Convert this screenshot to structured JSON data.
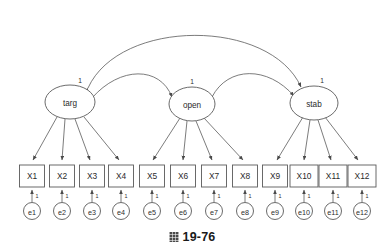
{
  "figure": {
    "caption_glyph": "figure-marker-glyph",
    "caption_number": "19-76",
    "diagram_type": "structural-equation-model-path-diagram"
  },
  "latent_factors": [
    {
      "id": "targ",
      "label": "targ",
      "cx": 70,
      "cy": 102,
      "rx": 25,
      "ry": 17,
      "fixed_label": "1",
      "fixed_x": 80,
      "fixed_y": 80
    },
    {
      "id": "open",
      "label": "open",
      "cx": 192,
      "cy": 104,
      "rx": 23,
      "ry": 17,
      "fixed_label": "1",
      "fixed_y": 81,
      "fixed_x": 192
    },
    {
      "id": "stab",
      "label": "stab",
      "cx": 314,
      "cy": 103,
      "rx": 24,
      "ry": 17,
      "fixed_label": "1",
      "fixed_x": 322,
      "fixed_y": 80
    }
  ],
  "indicators": [
    {
      "id": "X1",
      "label": "X1",
      "cx": 32,
      "factor": "targ",
      "width": 25
    },
    {
      "id": "X2",
      "label": "X2",
      "cx": 62,
      "factor": "targ",
      "width": 25
    },
    {
      "id": "X3",
      "label": "X3",
      "cx": 92,
      "factor": "targ",
      "width": 25
    },
    {
      "id": "X4",
      "label": "X4",
      "cx": 121,
      "factor": "targ",
      "width": 25
    },
    {
      "id": "X5",
      "label": "X5",
      "cx": 152,
      "factor": "open",
      "width": 25
    },
    {
      "id": "X6",
      "label": "X6",
      "cx": 183,
      "factor": "open",
      "width": 25
    },
    {
      "id": "X7",
      "label": "X7",
      "cx": 214,
      "factor": "open",
      "width": 25
    },
    {
      "id": "X8",
      "label": "X8",
      "cx": 245,
      "factor": "open",
      "width": 25
    },
    {
      "id": "X9",
      "label": "X9",
      "cx": 275,
      "factor": "stab",
      "width": 25
    },
    {
      "id": "X10",
      "label": "X10",
      "cx": 304,
      "factor": "stab",
      "width": 28
    },
    {
      "id": "X11",
      "label": "X11",
      "cx": 333,
      "factor": "stab",
      "width": 28
    },
    {
      "id": "X12",
      "label": "X12",
      "cx": 362,
      "factor": "stab",
      "width": 28
    }
  ],
  "indicator_row": {
    "top": 165,
    "height": 22
  },
  "errors": [
    {
      "id": "e1",
      "label": "e1",
      "cx": 32,
      "indicator": "X1",
      "fixed_label": "1"
    },
    {
      "id": "e2",
      "label": "e2",
      "cx": 62,
      "indicator": "X2",
      "fixed_label": "1"
    },
    {
      "id": "e3",
      "label": "e3",
      "cx": 92,
      "indicator": "X3",
      "fixed_label": "1"
    },
    {
      "id": "e4",
      "label": "e4",
      "cx": 121,
      "indicator": "X4",
      "fixed_label": "1"
    },
    {
      "id": "e5",
      "label": "e5",
      "cx": 152,
      "indicator": "X5",
      "fixed_label": "1"
    },
    {
      "id": "e6",
      "label": "e6",
      "cx": 183,
      "indicator": "X6",
      "fixed_label": "1"
    },
    {
      "id": "e7",
      "label": "e7",
      "cx": 214,
      "indicator": "X7",
      "fixed_label": "1"
    },
    {
      "id": "e8",
      "label": "e8",
      "cx": 245,
      "indicator": "X8",
      "fixed_label": "1"
    },
    {
      "id": "e9",
      "label": "e9",
      "cx": 275,
      "indicator": "X9",
      "fixed_label": "1"
    },
    {
      "id": "e10",
      "label": "e10",
      "cx": 304,
      "indicator": "X10",
      "fixed_label": "1"
    },
    {
      "id": "e11",
      "label": "e11",
      "cx": 333,
      "indicator": "X11",
      "fixed_label": "1"
    },
    {
      "id": "e12",
      "label": "e12",
      "cx": 362,
      "indicator": "X12",
      "fixed_label": "1"
    }
  ],
  "error_row": {
    "cy": 211,
    "r": 8.5
  },
  "covariances": [
    {
      "id": "targ-stab",
      "from": "targ",
      "to": "stab",
      "style": "double-headed-arc",
      "span": "wide"
    },
    {
      "id": "targ-open",
      "from": "targ",
      "to": "open",
      "style": "double-headed-arc",
      "span": "narrow"
    },
    {
      "id": "open-stab",
      "from": "open",
      "to": "stab",
      "style": "double-headed-arc",
      "span": "narrow"
    }
  ],
  "colors": {
    "stroke": "#5a5a5a",
    "text": "#2b2b2b",
    "background": "#ffffff",
    "caption": "#1a1a1a"
  }
}
